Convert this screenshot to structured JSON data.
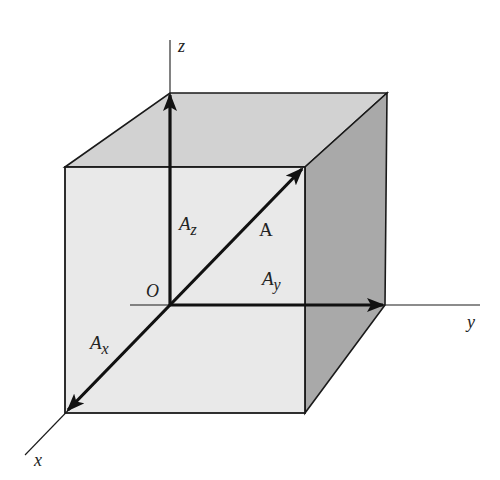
{
  "diagram": {
    "type": "vector-components-3d",
    "colors": {
      "background": "#ffffff",
      "front_face": "#e9e9e9",
      "top_face": "#d2d2d2",
      "right_face": "#a9a9a9",
      "line": "#1a1a1a"
    },
    "axes": {
      "x_label": "x",
      "y_label": "y",
      "z_label": "z",
      "origin_label": "O"
    },
    "vectors": {
      "A_label": "A",
      "Ax_base": "A",
      "Ax_sub": "x",
      "Ay_base": "A",
      "Ay_sub": "y",
      "Az_base": "A",
      "Az_sub": "z"
    }
  }
}
